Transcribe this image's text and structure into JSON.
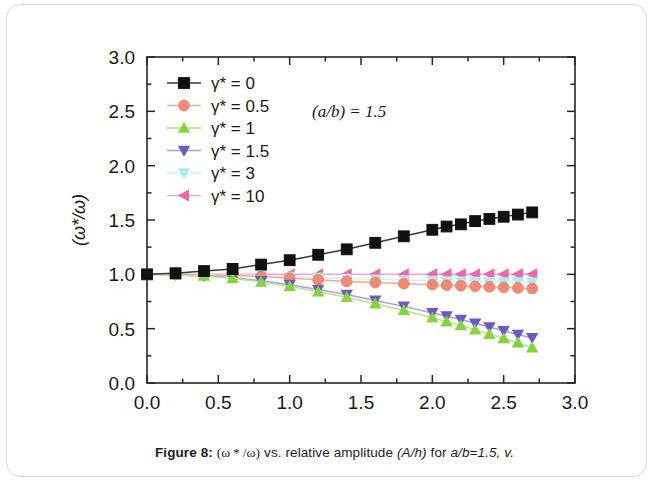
{
  "figure": {
    "caption_label": "Figure 8:",
    "caption_formula": "(ω * /ω)",
    "caption_rest_1": "vs. relative amplitude",
    "caption_param_1": "(A/h)",
    "caption_rest_2": "for",
    "caption_param_2": "a/b=1.5, v."
  },
  "annotation": {
    "text": "(a/b) = 1.5"
  },
  "chart_data": {
    "type": "line",
    "title": "",
    "xlabel": "(A/h)",
    "ylabel": "(ω*/ω)",
    "xlim": [
      0.0,
      3.0
    ],
    "ylim": [
      0.0,
      3.0
    ],
    "xticks": [
      "0.0",
      "0.5",
      "1.0",
      "1.5",
      "2.0",
      "2.5",
      "3.0"
    ],
    "xtick_values": [
      0.0,
      0.5,
      1.0,
      1.5,
      2.0,
      2.5,
      3.0
    ],
    "yticks": [
      "0.0",
      "0.5",
      "1.0",
      "1.5",
      "2.0",
      "2.5",
      "3.0"
    ],
    "ytick_values": [
      0.0,
      0.5,
      1.0,
      1.5,
      2.0,
      2.5,
      3.0
    ],
    "minor_tick_step": 0.25,
    "grid": false,
    "legend_position": "upper-left",
    "x": [
      0.0,
      0.2,
      0.4,
      0.6,
      0.8,
      1.0,
      1.2,
      1.4,
      1.6,
      1.8,
      2.0,
      2.1,
      2.2,
      2.3,
      2.4,
      2.5,
      2.6,
      2.7
    ],
    "series": [
      {
        "name": "γ* = 0",
        "gamma": "0",
        "marker": "square",
        "color": "#111111",
        "line_color": "#3a3a3a",
        "values": [
          1.0,
          1.01,
          1.03,
          1.05,
          1.09,
          1.13,
          1.18,
          1.23,
          1.29,
          1.35,
          1.41,
          1.44,
          1.46,
          1.49,
          1.51,
          1.53,
          1.55,
          1.57
        ]
      },
      {
        "name": "γ* = 0.5",
        "gamma": "0.5",
        "marker": "circle",
        "color": "#f08a72",
        "line_color": "#f5a897",
        "values": [
          1.0,
          1.0,
          0.995,
          0.99,
          0.98,
          0.965,
          0.95,
          0.935,
          0.925,
          0.915,
          0.905,
          0.9,
          0.895,
          0.89,
          0.885,
          0.88,
          0.875,
          0.87
        ]
      },
      {
        "name": "γ* = 1",
        "gamma": "1",
        "marker": "triangle-up",
        "color": "#86d341",
        "line_color": "#b5e68a",
        "values": [
          1.0,
          0.995,
          0.985,
          0.965,
          0.93,
          0.89,
          0.84,
          0.79,
          0.73,
          0.67,
          0.6,
          0.565,
          0.53,
          0.49,
          0.45,
          0.41,
          0.37,
          0.325
        ]
      },
      {
        "name": "γ* = 1.5",
        "gamma": "1.5",
        "marker": "triangle-down",
        "color": "#6a5bc4",
        "line_color": "#a99ee0",
        "values": [
          1.0,
          0.995,
          0.985,
          0.97,
          0.94,
          0.905,
          0.86,
          0.815,
          0.76,
          0.705,
          0.645,
          0.615,
          0.585,
          0.55,
          0.515,
          0.48,
          0.445,
          0.415
        ]
      },
      {
        "name": "γ* = 3",
        "gamma": "3",
        "marker": "triangle-down",
        "color": "#aeecf2",
        "line_color": "#cdf3f7",
        "values": [
          1.0,
          1.0,
          0.998,
          0.995,
          0.99,
          0.98,
          0.97,
          0.962,
          0.955,
          0.948,
          0.942,
          0.939,
          0.936,
          0.934,
          0.932,
          0.93,
          0.928,
          0.926
        ]
      },
      {
        "name": "γ* = 10",
        "gamma": "10",
        "marker": "triangle-left",
        "color": "#ef66a8",
        "line_color": "#f5a3c8",
        "values": [
          1.0,
          1.0,
          1.0,
          1.0,
          1.0,
          1.0,
          1.0,
          1.0,
          1.0,
          1.0,
          1.0,
          1.0,
          1.0,
          1.0,
          1.0,
          1.0,
          1.0,
          1.0
        ]
      }
    ]
  }
}
